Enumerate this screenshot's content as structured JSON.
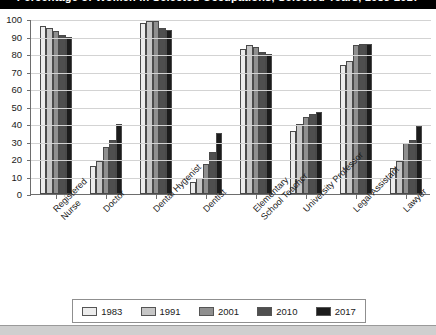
{
  "title": "Percentage of Women in Selected Occupations, Selected Years, 1983-2017",
  "legend": {
    "position": "bottom",
    "entries": [
      {
        "label": "1983",
        "color": "#ececec"
      },
      {
        "label": "1991",
        "color": "#c6c6c6"
      },
      {
        "label": "2001",
        "color": "#8f8f8f"
      },
      {
        "label": "2010",
        "color": "#4f4f4f"
      },
      {
        "label": "2017",
        "color": "#1c1c1c"
      }
    ]
  },
  "axis": {
    "y_ticks": [
      "0",
      "10",
      "20",
      "30",
      "40",
      "50",
      "60",
      "70",
      "80",
      "90",
      "100"
    ],
    "y_min": 0,
    "y_max": 100
  },
  "chart_data": {
    "type": "bar",
    "title": "Percentage of Women in Selected Occupations, Selected Years, 1983-2017",
    "xlabel": "",
    "ylabel": "",
    "ylim": [
      0,
      100
    ],
    "grid": true,
    "legend_position": "bottom",
    "categories": [
      "Registered Nurse",
      "Doctor",
      "Dental Hygenist",
      "Dentist",
      "Elementary School Teacher",
      "University Professor",
      "Legal Assistant",
      "Lawyer"
    ],
    "series": [
      {
        "name": "1983",
        "color": "#ececec",
        "values": [
          96,
          16,
          98,
          7,
          83,
          36,
          74,
          15
        ]
      },
      {
        "name": "1991",
        "color": "#c6c6c6",
        "values": [
          95,
          19,
          99,
          9,
          85,
          40,
          76,
          19
        ]
      },
      {
        "name": "2001",
        "color": "#8f8f8f",
        "values": [
          93,
          27,
          99,
          17,
          84,
          44,
          85,
          29
        ]
      },
      {
        "name": "2010",
        "color": "#4f4f4f",
        "values": [
          91,
          31,
          95,
          24,
          81,
          46,
          86,
          31
        ]
      },
      {
        "name": "2017",
        "color": "#1c1c1c",
        "values": [
          90,
          40,
          94,
          35,
          80,
          47,
          86,
          39
        ]
      }
    ]
  },
  "xlabel_lines": [
    [
      "Registered",
      "Nurse"
    ],
    [
      "Doctor"
    ],
    [
      "Dental Hygenist"
    ],
    [
      "Dentist"
    ],
    [
      "Elementary",
      "School Teacher"
    ],
    [
      "University Professor"
    ],
    [
      "Legal Assistant"
    ],
    [
      "Lawyer"
    ]
  ]
}
